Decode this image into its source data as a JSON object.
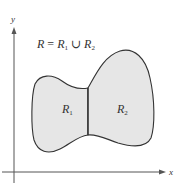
{
  "figure": {
    "axis_labels": {
      "x": "x",
      "y": "y"
    },
    "equation": {
      "lhs": "R",
      "eq": " = ",
      "r1": "R",
      "r1_sub": "1",
      "union": " ∪ ",
      "r2": "R",
      "r2_sub": "2"
    },
    "regions": [
      {
        "name": "R",
        "sub": "1"
      },
      {
        "name": "R",
        "sub": "2"
      }
    ],
    "colors": {
      "fill": "#e6e6e6",
      "stroke": "#333333",
      "axis": "#555555"
    }
  }
}
